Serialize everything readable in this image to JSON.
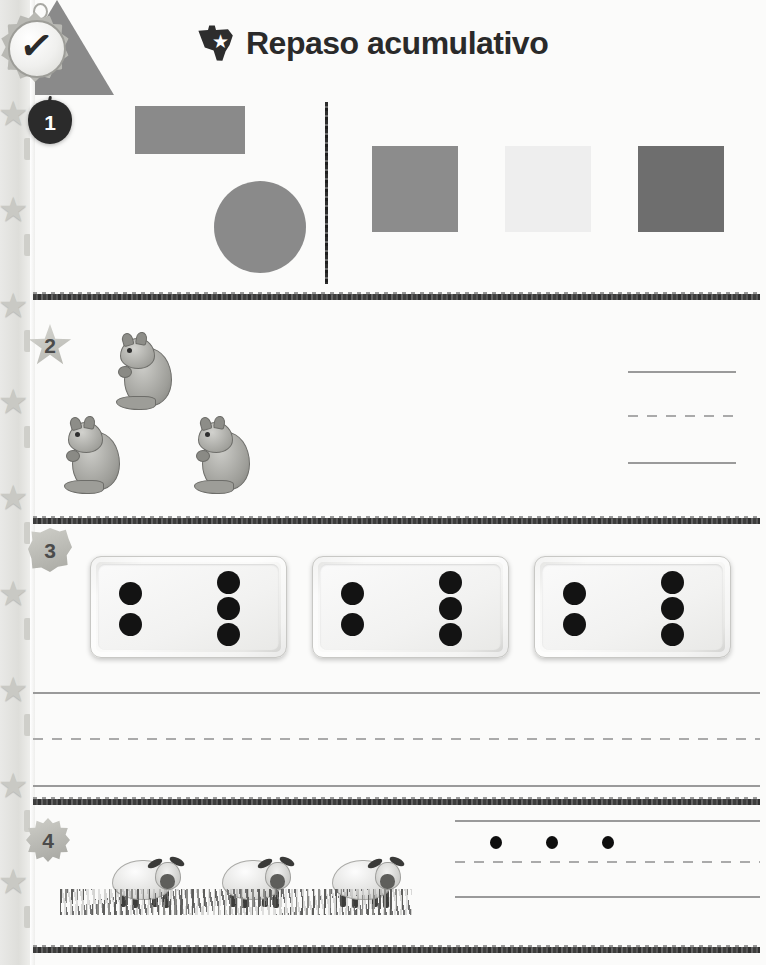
{
  "page": {
    "title": "Repaso acumulativo",
    "language": "es",
    "width": 766,
    "height": 965,
    "background_color": "#fbfbfa"
  },
  "header": {
    "title": "Repaso acumulativo",
    "icon_name": "texas-star-icon",
    "icon_star": "★",
    "title_color": "#2a2a2a"
  },
  "medal": {
    "icon_name": "checkmark-medal-icon",
    "check_glyph": "✓"
  },
  "sidebar_ribbon": {
    "star_glyph": "★",
    "star_count": 9,
    "tick_count": 9,
    "color": "#c9c9c4"
  },
  "problems": [
    {
      "number": "1",
      "badge_shape": "apple",
      "badge_name": "problem-number-1-apple-badge",
      "left_group": {
        "label": "shapes-group",
        "shapes": [
          {
            "name": "rectangle",
            "color": "#8a8a8a",
            "x": 135,
            "y": 106,
            "w": 110,
            "h": 48
          },
          {
            "name": "triangle",
            "color": "#8a8a8a",
            "x": 64,
            "y": 180,
            "w": 114,
            "h": 95
          },
          {
            "name": "circle",
            "color": "#8a8a8a",
            "x": 214,
            "y": 181,
            "w": 92,
            "h": 92
          }
        ]
      },
      "divider": {
        "name": "vertical-divider",
        "x": 325,
        "y": 102,
        "h": 182
      },
      "right_group": {
        "label": "squares-group",
        "squares": [
          {
            "name": "square-medium-gray",
            "color": "#8c8c8c",
            "x": 372
          },
          {
            "name": "square-light-gray",
            "color": "#eeeeee",
            "x": 505
          },
          {
            "name": "square-dark-gray",
            "color": "#6e6e6e",
            "x": 638
          }
        ]
      }
    },
    {
      "number": "2",
      "badge_shape": "star",
      "badge_name": "problem-number-2-star-badge",
      "object_name": "squirrel",
      "object_count": 3,
      "squirrels": [
        {
          "x": 110,
          "y": 326
        },
        {
          "x": 58,
          "y": 410
        },
        {
          "x": 188,
          "y": 410
        }
      ],
      "answer_lines": {
        "name": "handwriting-lines",
        "x": 628,
        "width": 108,
        "top_y": 371,
        "mid_y": 415,
        "bottom_y": 462
      }
    },
    {
      "number": "3",
      "badge_shape": "leaf",
      "badge_name": "problem-number-3-leaf-badge",
      "object_name": "domino",
      "dominoes": [
        {
          "x": 90,
          "left_pips": 2,
          "right_pips": 3
        },
        {
          "x": 312,
          "left_pips": 2,
          "right_pips": 3
        },
        {
          "x": 534,
          "left_pips": 2,
          "right_pips": 3
        }
      ],
      "answer_lines": {
        "name": "handwriting-lines",
        "x": 33,
        "width": 727,
        "top_y": 692,
        "mid_y": 738,
        "bottom_y": 785
      }
    },
    {
      "number": "4",
      "badge_shape": "gear",
      "badge_name": "problem-number-4-gear-badge",
      "object_name": "sheep",
      "object_count": 3,
      "sheep": [
        {
          "x": 108,
          "y": 848
        },
        {
          "x": 218,
          "y": 848
        },
        {
          "x": 328,
          "y": 848
        }
      ],
      "grass": {
        "name": "grass-strip",
        "x": 60,
        "y": 889,
        "w": 352
      },
      "answer_lines": {
        "name": "handwriting-lines",
        "x": 455,
        "width": 305,
        "top_y": 820,
        "mid_y": 861,
        "bottom_y": 896
      },
      "dots": {
        "name": "practice-dots",
        "count": 3,
        "color": "#0e0e0e",
        "positions": [
          490,
          546,
          602
        ],
        "y": 836
      }
    }
  ],
  "bands": [
    {
      "name": "section-band-1",
      "y": 294
    },
    {
      "name": "section-band-2",
      "y": 518
    },
    {
      "name": "section-band-3",
      "y": 799
    },
    {
      "name": "section-band-4",
      "y": 947
    }
  ]
}
